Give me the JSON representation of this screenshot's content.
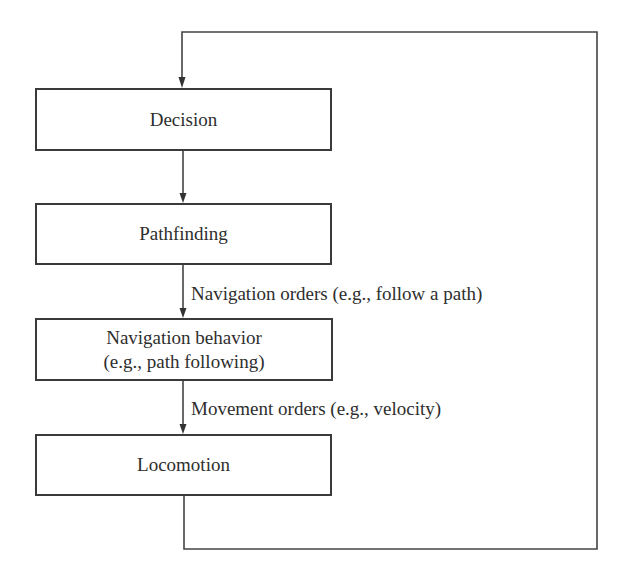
{
  "diagram": {
    "type": "flowchart",
    "boxes": [
      {
        "id": "decision",
        "label": "Decision"
      },
      {
        "id": "pathfinding",
        "label": "Pathfinding"
      },
      {
        "id": "navigation_behavior",
        "label": "Navigation behavior",
        "sublabel": "(e.g., path following)"
      },
      {
        "id": "locomotion",
        "label": "Locomotion"
      }
    ],
    "edges": [
      {
        "from": "decision",
        "to": "pathfinding",
        "label": ""
      },
      {
        "from": "pathfinding",
        "to": "navigation_behavior",
        "label": "Navigation orders (e.g., follow a path)"
      },
      {
        "from": "navigation_behavior",
        "to": "locomotion",
        "label": "Movement orders (e.g., velocity)"
      },
      {
        "from": "locomotion",
        "to": "decision",
        "label": "",
        "kind": "feedback-loop"
      }
    ],
    "colors": {
      "stroke": "#3a3a3a",
      "text": "#2e2e2e",
      "background": "#ffffff"
    }
  }
}
